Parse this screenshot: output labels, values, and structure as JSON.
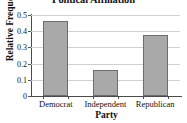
{
  "chart_data": {
    "type": "bar",
    "title": "Political Affiliation",
    "xlabel": "Party",
    "ylabel": "Relative Frequency",
    "categories": [
      "Democrat",
      "Independent",
      "Republican"
    ],
    "values": [
      0.465,
      0.16,
      0.375
    ],
    "ylim": [
      0,
      0.5
    ],
    "yticks": [
      0,
      0.1,
      0.2,
      0.3,
      0.4,
      0.5
    ],
    "ytick_labels": [
      "0",
      "0.1",
      "0.2",
      "0.3",
      "0.4",
      "0.5"
    ],
    "grid": true,
    "legend": false,
    "bar_color": "#a9a9a9",
    "bar_edge_color": "#6d6d6d",
    "grid_color": "#cfcfcf",
    "axis_color": "#4a4a4a"
  }
}
